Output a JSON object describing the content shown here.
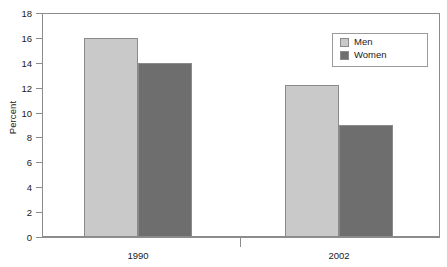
{
  "chart_data": {
    "type": "bar",
    "title": "",
    "subtitle": "",
    "xlabel": "",
    "ylabel": "Percent",
    "categories": [
      "1990",
      "2002"
    ],
    "series": [
      {
        "name": "Men",
        "values": [
          16.0,
          12.2
        ],
        "color": "#c9c9c9"
      },
      {
        "name": "Women",
        "values": [
          14.0,
          9.0
        ],
        "color": "#6e6e6e"
      }
    ],
    "ylim": [
      0,
      18
    ],
    "ytick_step": 2,
    "yticks": [
      "18",
      "16",
      "14",
      "12",
      "10",
      "8",
      "6",
      "4",
      "2",
      "0"
    ],
    "grid": true,
    "grid_axis": "y",
    "legend_position": "top-right",
    "legend_entries": [
      "Men",
      "Women"
    ],
    "bar_border_color": "#8a8a8a",
    "gridline_color": "#b3b3b3",
    "frame_color": "#8c8c8c",
    "background": "#ffffff"
  },
  "axis": {
    "y_title": "Percent"
  }
}
